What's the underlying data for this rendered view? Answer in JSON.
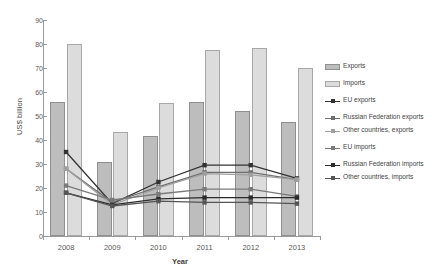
{
  "chart_data": {
    "type": "bar",
    "title": "",
    "subtitle": "",
    "xlabel": "Year",
    "ylabel": "US$ billion",
    "categories": [
      "2008",
      "2009",
      "2010",
      "2011",
      "2012",
      "2013"
    ],
    "ylim": [
      0,
      90
    ],
    "yticks": [
      0,
      10,
      20,
      30,
      40,
      50,
      60,
      70,
      80,
      90
    ],
    "grid": false,
    "legend_position": "right",
    "bar_series": [
      {
        "name": "Exports",
        "key_type": "swatch",
        "color": "#bdbdbd",
        "border": "#8f8f8f",
        "values": [
          56,
          31,
          41.5,
          56,
          52,
          47.5
        ]
      },
      {
        "name": "Imports",
        "key_type": "swatch",
        "color": "#dcdcdc",
        "border": "#a8a8a8",
        "values": [
          80,
          43.5,
          55.5,
          77.5,
          78.5,
          70
        ]
      }
    ],
    "line_series": [
      {
        "name": "EU exports",
        "key_type": "line",
        "color": "#333333",
        "values": [
          35,
          13.5,
          22.5,
          29.5,
          29.5,
          24
        ]
      },
      {
        "name": "Russian Federation exports",
        "key_type": "line",
        "color": "#6e6e6e",
        "values": [
          28,
          14,
          20.5,
          26.5,
          26.5,
          23.5
        ]
      },
      {
        "name": "Other countries, exports",
        "key_type": "line",
        "color": "#a0a0a0",
        "values": [
          28,
          13,
          20,
          26,
          25.5,
          23.5
        ]
      },
      {
        "name": "EU imports",
        "key_type": "line",
        "color": "#7a7a7a",
        "values": [
          21,
          15,
          17.5,
          19.5,
          19.5,
          16.5
        ]
      },
      {
        "name": "Russian Federation imports",
        "key_type": "line",
        "color": "#2b2b2b",
        "values": [
          18,
          13,
          15.5,
          16,
          16,
          16
        ]
      },
      {
        "name": "Other countries, imports",
        "key_type": "line",
        "color": "#555555",
        "values": [
          18,
          12.5,
          14.5,
          14,
          14,
          13.5
        ]
      }
    ]
  }
}
